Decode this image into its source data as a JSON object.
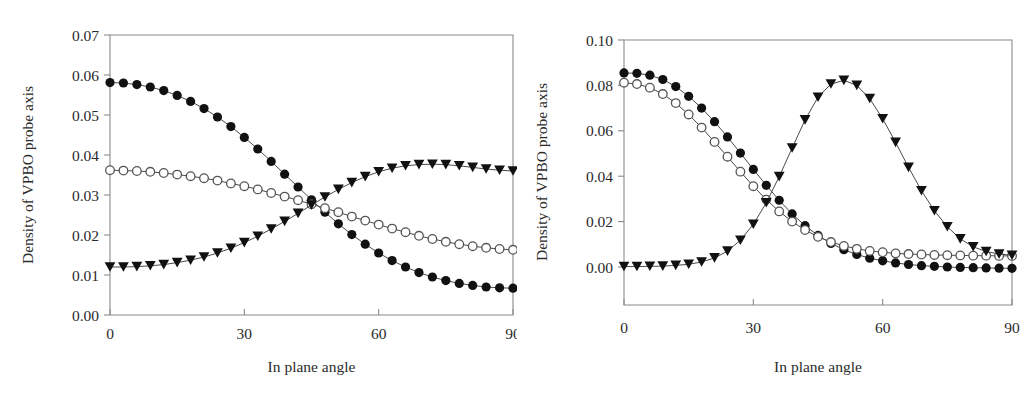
{
  "figure": {
    "background": "#ffffff",
    "panel_count": 2
  },
  "chart_data": [
    {
      "panel": "left",
      "type": "scatter",
      "title": "",
      "xlabel": "In plane angle",
      "ylabel": "Density of VPBO probe axis",
      "xlim": [
        0,
        90
      ],
      "ylim": [
        0.0,
        0.07
      ],
      "xticks": [
        0,
        30,
        60,
        90
      ],
      "xtick_labels": [
        "0",
        "30",
        "60",
        "90"
      ],
      "yticks": [
        0.0,
        0.01,
        0.02,
        0.03,
        0.04,
        0.05,
        0.06,
        0.07
      ],
      "ytick_labels": [
        "0.00",
        "0.01",
        "0.02",
        "0.03",
        "0.04",
        "0.05",
        "0.06",
        "0.07"
      ],
      "grid": false,
      "legend": "none",
      "x": [
        0,
        3,
        6,
        9,
        12,
        15,
        18,
        21,
        24,
        27,
        30,
        33,
        36,
        39,
        42,
        45,
        48,
        51,
        54,
        57,
        60,
        63,
        66,
        69,
        72,
        75,
        78,
        81,
        84,
        87,
        90
      ],
      "series": [
        {
          "name": "filled-circle",
          "marker": "filled-circle",
          "values": [
            0.0581,
            0.058,
            0.0576,
            0.057,
            0.0561,
            0.0549,
            0.0534,
            0.0516,
            0.0495,
            0.0471,
            0.0444,
            0.0415,
            0.0384,
            0.0352,
            0.032,
            0.0288,
            0.0257,
            0.0228,
            0.0201,
            0.0177,
            0.0155,
            0.0136,
            0.012,
            0.0106,
            0.0095,
            0.0086,
            0.0079,
            0.0074,
            0.007,
            0.0068,
            0.0067
          ]
        },
        {
          "name": "open-circle",
          "marker": "open-circle",
          "values": [
            0.0362,
            0.0361,
            0.036,
            0.0358,
            0.0355,
            0.0351,
            0.0347,
            0.0342,
            0.0336,
            0.0329,
            0.0322,
            0.0314,
            0.0305,
            0.0296,
            0.0287,
            0.0277,
            0.0267,
            0.0257,
            0.0246,
            0.0236,
            0.0226,
            0.0216,
            0.0207,
            0.0198,
            0.019,
            0.0183,
            0.0177,
            0.0172,
            0.0168,
            0.0165,
            0.0163
          ]
        },
        {
          "name": "filled-triangle",
          "marker": "filled-triangle",
          "values": [
            0.012,
            0.012,
            0.0121,
            0.0123,
            0.0126,
            0.0131,
            0.0137,
            0.0145,
            0.0155,
            0.0167,
            0.0181,
            0.0197,
            0.0215,
            0.0234,
            0.0254,
            0.0275,
            0.0295,
            0.0314,
            0.0331,
            0.0346,
            0.0358,
            0.0367,
            0.0373,
            0.0376,
            0.0377,
            0.0376,
            0.0373,
            0.0369,
            0.0365,
            0.0362,
            0.036
          ]
        }
      ]
    },
    {
      "panel": "right",
      "type": "scatter",
      "title": "",
      "xlabel": "In plane angle",
      "ylabel": "Density of VPBO probe axis",
      "xlim": [
        0,
        90
      ],
      "ylim": [
        -0.016,
        0.1
      ],
      "xticks": [
        0,
        30,
        60,
        90
      ],
      "xtick_labels": [
        "0",
        "30",
        "60",
        "90"
      ],
      "yticks": [
        0.0,
        0.02,
        0.04,
        0.06,
        0.08,
        0.1
      ],
      "ytick_labels": [
        "0.00",
        "0.02",
        "0.04",
        "0.06",
        "0.08",
        "0.10"
      ],
      "grid": false,
      "legend": "none",
      "x": [
        0,
        3,
        6,
        9,
        12,
        15,
        18,
        21,
        24,
        27,
        30,
        33,
        36,
        39,
        42,
        45,
        48,
        51,
        54,
        57,
        60,
        63,
        66,
        69,
        72,
        75,
        78,
        81,
        84,
        87,
        90
      ],
      "series": [
        {
          "name": "filled-circle",
          "marker": "filled-circle",
          "values": [
            0.0855,
            0.0853,
            0.0845,
            0.0826,
            0.0795,
            0.0752,
            0.07,
            0.064,
            0.0573,
            0.0502,
            0.043,
            0.036,
            0.0294,
            0.0234,
            0.0182,
            0.0139,
            0.0104,
            0.0076,
            0.0055,
            0.0039,
            0.0027,
            0.0018,
            0.0011,
            0.0006,
            0.0003,
            0.0,
            -0.0002,
            -0.0003,
            -0.0004,
            -0.0005,
            -0.0006
          ]
        },
        {
          "name": "open-circle",
          "marker": "open-circle",
          "values": [
            0.0812,
            0.0806,
            0.079,
            0.0762,
            0.0722,
            0.0672,
            0.0614,
            0.0551,
            0.0486,
            0.042,
            0.0356,
            0.0297,
            0.0245,
            0.02,
            0.0163,
            0.0133,
            0.011,
            0.0093,
            0.008,
            0.0071,
            0.0065,
            0.006,
            0.0057,
            0.0055,
            0.0053,
            0.0052,
            0.0051,
            0.005,
            0.005,
            0.0049,
            0.0049
          ]
        },
        {
          "name": "filled-triangle",
          "marker": "filled-triangle",
          "values": [
            0.0002,
            0.0002,
            0.0003,
            0.0004,
            0.0007,
            0.0012,
            0.0022,
            0.004,
            0.007,
            0.0118,
            0.0188,
            0.0283,
            0.0398,
            0.0524,
            0.0648,
            0.0748,
            0.0806,
            0.0822,
            0.08,
            0.0742,
            0.0653,
            0.0549,
            0.0439,
            0.0336,
            0.0248,
            0.0177,
            0.0124,
            0.0089,
            0.0068,
            0.0057,
            0.0052
          ]
        }
      ]
    }
  ]
}
